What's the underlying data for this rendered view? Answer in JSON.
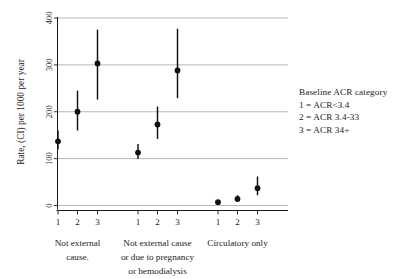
{
  "chart_data": {
    "type": "scatter",
    "title": "",
    "xlabel": "",
    "ylabel": "Rate, (CI) per 1000 per year",
    "ylim": [
      0,
      400
    ],
    "yticks": [
      0,
      100,
      200,
      300,
      400
    ],
    "ytick_labels": [
      "0",
      "100",
      "200",
      "300",
      "400"
    ],
    "grid": true,
    "grid_axis": "y",
    "legend_position": "right",
    "marker": "filled-circle-with-error-bars",
    "error_bar_type": "95% CI",
    "categories": [
      "1",
      "2",
      "3",
      "1",
      "2",
      "3",
      "1",
      "2",
      "3"
    ],
    "groups": [
      {
        "label": "Not external cause.",
        "label_lines": [
          "Not external",
          "cause."
        ],
        "points": [
          {
            "x_tick": "1",
            "acr_category": "1 = ACR<3.4",
            "value": 137,
            "ci_low": 120,
            "ci_high": 160
          },
          {
            "x_tick": "2",
            "acr_category": "2 = ACR 3.4-33",
            "value": 200,
            "ci_low": 160,
            "ci_high": 245
          },
          {
            "x_tick": "3",
            "acr_category": "3 = ACR 34+",
            "value": 303,
            "ci_low": 226,
            "ci_high": 375
          }
        ]
      },
      {
        "label": "Not external cause or due to pregnancy or hemodialysis",
        "label_lines": [
          "Not external cause",
          "or due to pregnancy",
          "or hemodialysis"
        ],
        "points": [
          {
            "x_tick": "1",
            "acr_category": "1 = ACR<3.4",
            "value": 113,
            "ci_low": 99,
            "ci_high": 131
          },
          {
            "x_tick": "2",
            "acr_category": "2 = ACR 3.4-33",
            "value": 173,
            "ci_low": 142,
            "ci_high": 211
          },
          {
            "x_tick": "3",
            "acr_category": "3 = ACR 34+",
            "value": 288,
            "ci_low": 229,
            "ci_high": 377
          }
        ]
      },
      {
        "label": "Circulatory only",
        "label_lines": [
          "Circulatory only"
        ],
        "points": [
          {
            "x_tick": "1",
            "acr_category": "1 = ACR<3.4",
            "value": 7,
            "ci_low": 4,
            "ci_high": 11
          },
          {
            "x_tick": "2",
            "acr_category": "2 = ACR 3.4-33",
            "value": 14,
            "ci_low": 8,
            "ci_high": 22
          },
          {
            "x_tick": "3",
            "acr_category": "3 = ACR 34+",
            "value": 37,
            "ci_low": 22,
            "ci_high": 62
          }
        ]
      }
    ]
  },
  "legend": {
    "title": "Baseline ACR category",
    "entries": [
      "1 = ACR<3.4",
      "2 = ACR 3.4-33",
      "3 = ACR 34+"
    ]
  },
  "colors": {
    "marker": "#111111",
    "grid": "#9a9a9a",
    "axis": "#1a1a1a",
    "text": "#1c1c1c",
    "background": "#ffffff"
  }
}
